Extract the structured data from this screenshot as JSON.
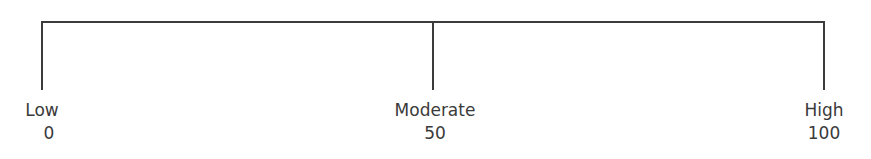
{
  "scale": {
    "points": [
      {
        "label": "Low",
        "value": "0"
      },
      {
        "label": "Moderate",
        "value": "50"
      },
      {
        "label": "High",
        "value": "100"
      }
    ],
    "line_color": "#3c3c3c",
    "text_color": "#3a3a3a"
  }
}
